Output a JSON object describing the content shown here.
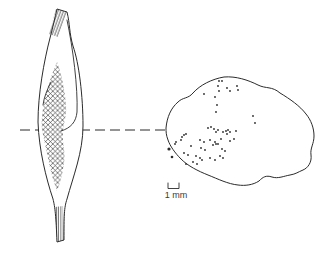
{
  "figure": {
    "background": "#ffffff",
    "line_color": "#2b2b2b",
    "muscle_lateral_view": {
      "outline_path": "M57,9 L67,12 C70,24 69,32 73,46 C79,63 83,96 83,126 C83,152 73,177 67,199 C64,208 64,216 64,240 L57,242 C56,216 55,207 53,199 C46,178 39,150 38,122 C38,94 44,61 50,38 C53,27 55,17 57,9 Z",
      "hatched_region_path": "M57,62 C61,72 65,90 66,105 C67,117 63,124 63,132 C62,145 66,152 64,163 C62,176 60,184 57,191 C54,183 51,172 49,163 C47,152 44,140 42,130 C41,118 43,108 45,98 C48,85 53,71 57,62 Z",
      "inner_boundary_path": "M67,20 C73,48 78,88 77,112 C76,122 71,128 61,131",
      "inner_hook_path": "M51,82 C47,90 44,97 43,105",
      "top_tendon_path": "M56,9 L67,12 L58,37 L49,34 Z",
      "bottom_tendon_path": "M55,207 L63,206 L64,240 L57,242 Z"
    },
    "section_line": {
      "x1": 20,
      "x2": 166,
      "y": 130,
      "dash": "10 5"
    },
    "cross_section": {
      "outline_path": "M166,128 C167,117 171,108 178,102 C183,97 188,99 193,93 C200,85 212,79 224,77 C236,76 248,80 258,85 C266,89 272,86 280,93 C290,99 300,106 306,114 C311,120 314,128 314,136 C314,144 310,148 311,155 C312,162 308,168 303,170 C298,172 296,174 290,175 C284,176 278,179 272,177 C266,175 263,177 259,181 C253,185 245,186 238,185 C228,184 218,179 208,175 C198,171 188,166 181,159 C175,153 170,146 168,140 C166,135 166,131 166,128 Z",
      "dot_radius": 0.9,
      "dots": [
        [
          219,
          81
        ],
        [
          222,
          81
        ],
        [
          218,
          86
        ],
        [
          219,
          91
        ],
        [
          227,
          88
        ],
        [
          230,
          91
        ],
        [
          237,
          86
        ],
        [
          238,
          90
        ],
        [
          204,
          94
        ],
        [
          215,
          97
        ],
        [
          217,
          105
        ],
        [
          216,
          112
        ],
        [
          253,
          116
        ],
        [
          255,
          123
        ],
        [
          208,
          128
        ],
        [
          211,
          127
        ],
        [
          214,
          129
        ],
        [
          218,
          130
        ],
        [
          216,
          132
        ],
        [
          223,
          132
        ],
        [
          226,
          131
        ],
        [
          228,
          130
        ],
        [
          230,
          132
        ],
        [
          227,
          134
        ],
        [
          236,
          131
        ],
        [
          234,
          139
        ],
        [
          230,
          141
        ],
        [
          221,
          139
        ],
        [
          216,
          144
        ],
        [
          222,
          149
        ],
        [
          225,
          151
        ],
        [
          220,
          156
        ],
        [
          223,
          158
        ],
        [
          182,
          137
        ],
        [
          184,
          135
        ],
        [
          186,
          134
        ],
        [
          181,
          140
        ],
        [
          176,
          142
        ],
        [
          175,
          144
        ],
        [
          200,
          140
        ],
        [
          204,
          142
        ],
        [
          210,
          140
        ],
        [
          215,
          142
        ],
        [
          218,
          144
        ],
        [
          213,
          145
        ],
        [
          191,
          146
        ],
        [
          201,
          148
        ],
        [
          205,
          150
        ],
        [
          184,
          153
        ],
        [
          188,
          155
        ],
        [
          196,
          156
        ],
        [
          200,
          158
        ],
        [
          202,
          160
        ],
        [
          210,
          158
        ],
        [
          215,
          160
        ],
        [
          193,
          162
        ],
        [
          197,
          164
        ],
        [
          186,
          164
        ]
      ],
      "edge_dots": [
        [
          169,
          149,
          1.6
        ],
        [
          172,
          157,
          1.3
        ]
      ]
    },
    "scale_bar": {
      "bracket_path": "M168,183 L168,188.5 L179,188.5 L179,183",
      "label": "1 mm"
    }
  }
}
